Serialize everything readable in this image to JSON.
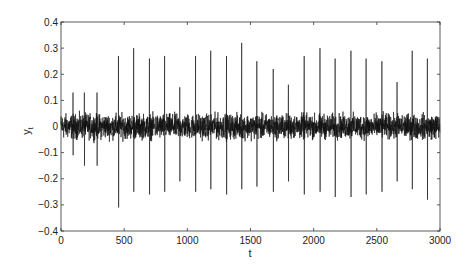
{
  "chart_data": {
    "type": "line",
    "title": "",
    "xlabel": "t",
    "ylabel": "y",
    "ylabel_subscript": "t",
    "xlim": [
      0,
      3000
    ],
    "ylim": [
      -0.4,
      0.4
    ],
    "x_ticks": [
      0,
      500,
      1000,
      1500,
      2000,
      2500,
      3000
    ],
    "y_ticks": [
      -0.4,
      -0.3,
      -0.2,
      -0.1,
      0,
      0.1,
      0.2,
      0.3,
      0.4
    ],
    "y_tick_labels": [
      "−0.4",
      "−0.3",
      "−0.2",
      "−0.1",
      "0",
      "0.1",
      "0.2",
      "0.3",
      "0.4"
    ],
    "grid": false,
    "legend": null,
    "series": [
      {
        "name": "y_t",
        "description": "noisy time series, baseline noise amplitude ~±0.05 with periodic spikes every ~120 samples",
        "noise_amplitude": 0.05,
        "spikes": [
          {
            "t": 455,
            "max": 0.27,
            "min": -0.31
          },
          {
            "t": 575,
            "max": 0.3,
            "min": -0.25
          },
          {
            "t": 700,
            "max": 0.26,
            "min": -0.26
          },
          {
            "t": 820,
            "max": 0.27,
            "min": -0.25
          },
          {
            "t": 940,
            "max": 0.15,
            "min": -0.21
          },
          {
            "t": 1065,
            "max": 0.27,
            "min": -0.25
          },
          {
            "t": 1185,
            "max": 0.29,
            "min": -0.24
          },
          {
            "t": 1310,
            "max": 0.27,
            "min": -0.26
          },
          {
            "t": 1430,
            "max": 0.32,
            "min": -0.24
          },
          {
            "t": 1550,
            "max": 0.25,
            "min": -0.23
          },
          {
            "t": 1680,
            "max": 0.22,
            "min": -0.25
          },
          {
            "t": 1800,
            "max": 0.16,
            "min": -0.21
          },
          {
            "t": 1925,
            "max": 0.27,
            "min": -0.26
          },
          {
            "t": 2050,
            "max": 0.3,
            "min": -0.25
          },
          {
            "t": 2170,
            "max": 0.26,
            "min": -0.27
          },
          {
            "t": 2295,
            "max": 0.29,
            "min": -0.27
          },
          {
            "t": 2415,
            "max": 0.26,
            "min": -0.26
          },
          {
            "t": 2540,
            "max": 0.25,
            "min": -0.25
          },
          {
            "t": 2660,
            "max": 0.17,
            "min": -0.21
          },
          {
            "t": 2780,
            "max": 0.29,
            "min": -0.24
          },
          {
            "t": 2900,
            "max": 0.26,
            "min": -0.28
          }
        ],
        "early_peaks": [
          {
            "t": 95,
            "max": 0.13,
            "min": -0.11
          },
          {
            "t": 185,
            "max": 0.13,
            "min": -0.15
          },
          {
            "t": 285,
            "max": 0.13,
            "min": -0.15
          }
        ]
      }
    ]
  }
}
